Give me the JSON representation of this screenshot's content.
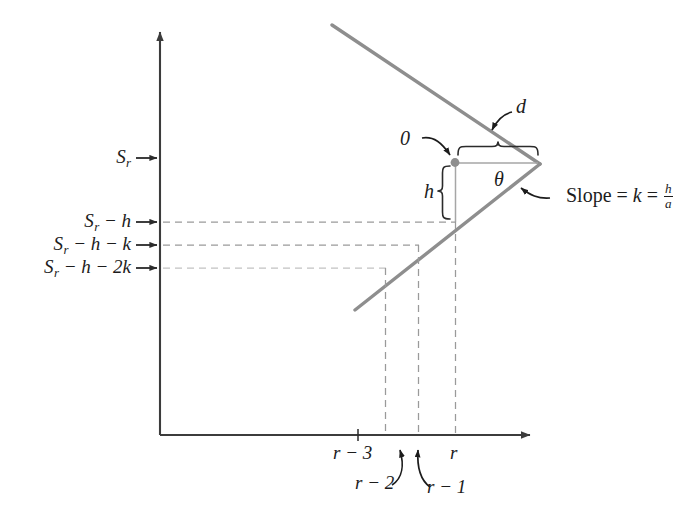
{
  "figure": {
    "colors": {
      "axis": "#3c3c3c",
      "signal_line": "#8c8c8c",
      "dashed_guide": "#9a9a9a",
      "dashed_guide_faint": "#c2c2c2",
      "annotation": "#1c1c1c",
      "vertex_dot": "#8c8c8c",
      "background": "#ffffff"
    }
  },
  "axes": {
    "y_axis_name": "vertical-axis",
    "x_axis_name": "horizontal-axis",
    "origin_label": "",
    "y_ticks": [
      {
        "id": "s-r",
        "label_upper": "S",
        "label_sub": "r",
        "label_rest": "",
        "full": "S_r",
        "y": 158
      },
      {
        "id": "s-r-h",
        "label_upper": "S",
        "label_sub": "r",
        "label_rest": " − h",
        "full": "S_r − h",
        "y": 222
      },
      {
        "id": "s-r-h-k",
        "label_upper": "S",
        "label_sub": "r",
        "label_rest": " − h − k",
        "full": "S_r − h − k",
        "y": 245
      },
      {
        "id": "s-r-h-2k",
        "label_upper": "S",
        "label_sub": "r",
        "label_rest": " − h − 2k",
        "full": "S_r − h − 2k",
        "y": 268
      }
    ],
    "x_ticks": [
      {
        "id": "r-minus-3",
        "label": "r − 3",
        "x": 385
      },
      {
        "id": "r-minus-2",
        "label": "r − 2",
        "x": 418
      },
      {
        "id": "r-minus-1",
        "label": "r − 1",
        "x": 455
      },
      {
        "id": "r",
        "label": "r",
        "x": 455
      }
    ]
  },
  "annotations": {
    "zero_label": "0",
    "d_label": "d",
    "h_label": "h",
    "theta_label": "θ",
    "slope_prefix": "Slope = ",
    "slope_var": "k",
    "slope_eq": " = ",
    "slope_num": "h",
    "slope_den": "a"
  },
  "y_axis_labels": {
    "sr": "S",
    "sr_sub": "r",
    "sr_h_rest": " − h",
    "sr_h_k_rest": " − h − k",
    "sr_h_2k_rest": " − h − 2k"
  },
  "x_axis_labels": {
    "r3": "r − 3",
    "r2": "r − 2",
    "r1": "r − 1",
    "r": "r"
  }
}
